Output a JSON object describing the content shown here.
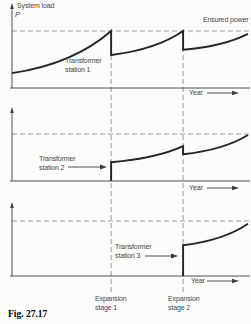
{
  "figure": {
    "caption": "Fig. 27.17",
    "y_axis_title": "System load",
    "y_axis_symbol": "P",
    "ensured_power_label": "Ensured power",
    "year_label": "Year",
    "expansion_labels": [
      {
        "line1": "Expansion",
        "line2": "stage 1"
      },
      {
        "line1": "Expansion",
        "line2": "stage 2"
      }
    ]
  },
  "colors": {
    "curve": "#252525",
    "axis": "#3c3c3c",
    "dashed": "#8f8f8f",
    "text": "#474747",
    "background": "#fcfcfa"
  },
  "chart_data": {
    "type": "line",
    "xlabel": "Year",
    "ylabel": "System load P",
    "grid": false,
    "legend": false,
    "x_range_normalized": [
      0,
      1
    ],
    "y_range_normalized": [
      0,
      1
    ],
    "reference_line": {
      "label": "Ensured power",
      "y": 1.0,
      "style": "dashed"
    },
    "x_markers": [
      {
        "label": "Expansion stage 1",
        "x": 0.42
      },
      {
        "label": "Expansion stage 2",
        "x": 0.725
      }
    ],
    "panels": [
      {
        "name": "Transformer station 1",
        "label_lines": [
          "Transformer",
          "station 1"
        ],
        "has_pointer_arrow": false,
        "segments": [
          {
            "type": "growth",
            "x0": 0.0,
            "y0": 0.26,
            "x1": 0.42,
            "y1": 1.0
          },
          {
            "type": "drop",
            "x": 0.42,
            "y0": 1.0,
            "y1": 0.58
          },
          {
            "type": "growth",
            "x0": 0.42,
            "y0": 0.58,
            "x1": 0.725,
            "y1": 1.0
          },
          {
            "type": "drop",
            "x": 0.725,
            "y0": 1.0,
            "y1": 0.67
          },
          {
            "type": "growth",
            "x0": 0.725,
            "y0": 0.67,
            "x1": 1.0,
            "y1": 0.95
          }
        ]
      },
      {
        "name": "Transformer station 2",
        "label_lines": [
          "Transformer",
          "station 2"
        ],
        "has_pointer_arrow": true,
        "segments": [
          {
            "type": "rise",
            "x": 0.42,
            "y0": 0.0,
            "y1": 0.4
          },
          {
            "type": "growth",
            "x0": 0.42,
            "y0": 0.4,
            "x1": 0.725,
            "y1": 0.74
          },
          {
            "type": "drop",
            "x": 0.725,
            "y0": 0.74,
            "y1": 0.57
          },
          {
            "type": "growth",
            "x0": 0.725,
            "y0": 0.57,
            "x1": 1.0,
            "y1": 0.98
          }
        ]
      },
      {
        "name": "Transformer station 3",
        "label_lines": [
          "Transformer",
          "station 3"
        ],
        "has_pointer_arrow": true,
        "segments": [
          {
            "type": "rise",
            "x": 0.725,
            "y0": 0.0,
            "y1": 0.56
          },
          {
            "type": "growth",
            "x0": 0.725,
            "y0": 0.56,
            "x1": 1.0,
            "y1": 0.95
          }
        ]
      }
    ]
  }
}
